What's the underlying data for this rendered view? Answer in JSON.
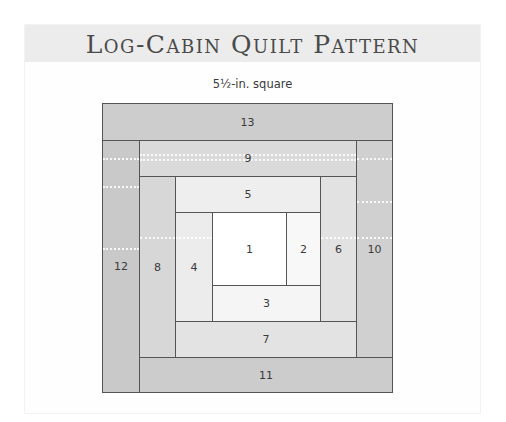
{
  "header": {
    "title": "Log-Cabin Quilt Pattern"
  },
  "diagram": {
    "subtitle": "5½-in. square",
    "pieces": [
      {
        "id": "13",
        "label": "13",
        "color": "#cdcdcd"
      },
      {
        "id": "12",
        "label": "12",
        "color": "#c9c9c9"
      },
      {
        "id": "11",
        "label": "11",
        "color": "#cccccc"
      },
      {
        "id": "10",
        "label": "10",
        "color": "#d0d0d0"
      },
      {
        "id": "9",
        "label": "9",
        "color": "#dadada"
      },
      {
        "id": "8",
        "label": "8",
        "color": "#d7d7d7"
      },
      {
        "id": "7",
        "label": "7",
        "color": "#e3e3e3"
      },
      {
        "id": "6",
        "label": "6",
        "color": "#e2e2e2"
      },
      {
        "id": "5",
        "label": "5",
        "color": "#eeeeee"
      },
      {
        "id": "4",
        "label": "4",
        "color": "#ececec"
      },
      {
        "id": "3",
        "label": "3",
        "color": "#f5f5f5"
      },
      {
        "id": "2",
        "label": "2",
        "color": "#f8f8f8"
      },
      {
        "id": "1",
        "label": "1",
        "color": "#ffffff"
      }
    ]
  }
}
